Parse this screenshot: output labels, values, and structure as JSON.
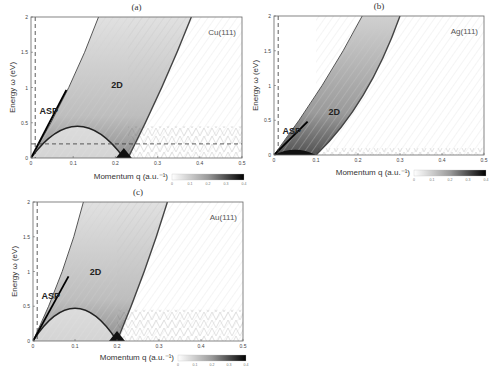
{
  "chart_data": [
    {
      "type": "heatmap",
      "panel": "(a)",
      "material": "Cu(111)",
      "xlabel": "Momentum q (a.u.⁻¹)",
      "ylabel": "Energy ω (eV)",
      "xlim": [
        0,
        0.5
      ],
      "ylim": [
        0,
        2
      ],
      "xticks": [
        "0",
        "0.1",
        "0.2",
        "0.3",
        "0.4",
        "0.5"
      ],
      "yticks": [
        "0",
        "0.5",
        "1",
        "1.5",
        "2"
      ],
      "colorbar": {
        "ticks": [
          "0",
          "0.1",
          "0.2",
          "0.3",
          "0.4"
        ],
        "range": [
          0,
          0.4
        ]
      },
      "annotations": [
        {
          "text": "ASP",
          "x": 0.02,
          "y": 0.62
        },
        {
          "text": "2D",
          "x": 0.19,
          "y": 1.0
        }
      ],
      "reference_lines": {
        "vertical_dashed_q": 0.01,
        "horizontal_dashed_eV": 0.2
      },
      "features": {
        "asp_line_slope": 11.5,
        "dome_end_q": 0.22,
        "dome_peak_eV": 0.45,
        "dome_peak_q": 0.11,
        "band_2d_left_q_at_0": 0.0,
        "band_2d_right_q_at_0": 0.23,
        "band_2d_top_left_q": 0.16,
        "band_2d_top_right_q": 0.38,
        "interband_region_max_eV": 0.45
      }
    },
    {
      "type": "heatmap",
      "panel": "(b)",
      "material": "Ag(111)",
      "xlabel": "Momentum q (a.u.⁻¹)",
      "ylabel": "Energy ω (eV)",
      "xlim": [
        0,
        0.5
      ],
      "ylim": [
        0,
        2
      ],
      "xticks": [
        "0",
        "0.1",
        "0.2",
        "0.3",
        "0.4",
        "0.5"
      ],
      "yticks": [
        "0",
        "0.5",
        "1",
        "1.5",
        "2"
      ],
      "colorbar": {
        "ticks": [
          "0",
          "0.1",
          "0.2",
          "0.3",
          "0.4"
        ],
        "range": [
          0,
          0.4
        ]
      },
      "annotations": [
        {
          "text": "ASP",
          "x": 0.02,
          "y": 0.3
        },
        {
          "text": "2D",
          "x": 0.13,
          "y": 0.58
        }
      ],
      "reference_lines": {
        "vertical_dashed_q": 0.01
      },
      "features": {
        "band_2d_left_q_at_0": 0.0,
        "band_2d_right_q_at_0": 0.1,
        "band_2d_top_left_q": 0.21,
        "band_2d_top_right_q": 0.3,
        "interband_region_max_eV": 0.1
      }
    },
    {
      "type": "heatmap",
      "panel": "(c)",
      "material": "Au(111)",
      "xlabel": "Momentum q (a.u.⁻¹)",
      "ylabel": "Energy ω (eV)",
      "xlim": [
        0,
        0.5
      ],
      "ylim": [
        0,
        2
      ],
      "xticks": [
        "0",
        "0.1",
        "0.2",
        "0.3",
        "0.4",
        "0.5"
      ],
      "yticks": [
        "0",
        "0.5",
        "1",
        "1.5",
        "2"
      ],
      "colorbar": {
        "ticks": [
          "0",
          "0.1",
          "0.2",
          "0.3",
          "0.4"
        ],
        "range": [
          0,
          0.4
        ]
      },
      "annotations": [
        {
          "text": "ASP",
          "x": 0.02,
          "y": 0.6
        },
        {
          "text": "2D",
          "x": 0.135,
          "y": 0.95
        }
      ],
      "reference_lines": {
        "vertical_dashed_q": 0.01
      },
      "features": {
        "asp_line_slope": 11.0,
        "dome_end_q": 0.2,
        "dome_peak_eV": 0.47,
        "dome_peak_q": 0.1,
        "band_2d_left_q_at_0": 0.0,
        "band_2d_right_q_at_0": 0.2,
        "band_2d_top_left_q": 0.12,
        "band_2d_top_right_q": 0.32,
        "interband_region_max_eV": 0.45
      }
    }
  ]
}
